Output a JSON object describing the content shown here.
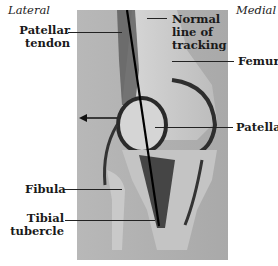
{
  "figure": {
    "orientation": {
      "left": "Lateral",
      "right": "Medial"
    },
    "labels": {
      "patellar_tendon": [
        "Patellar",
        "tendon"
      ],
      "normal_line": [
        "Normal",
        "line of",
        "tracking"
      ],
      "femur": "Femur",
      "patella": "Patella",
      "fibula": "Fibula",
      "tibial_tubercle": [
        "Tibial",
        "tubercle"
      ]
    },
    "annotations": {
      "lateral_arrow": "arrow-left",
      "tracking_line": "black line"
    }
  }
}
